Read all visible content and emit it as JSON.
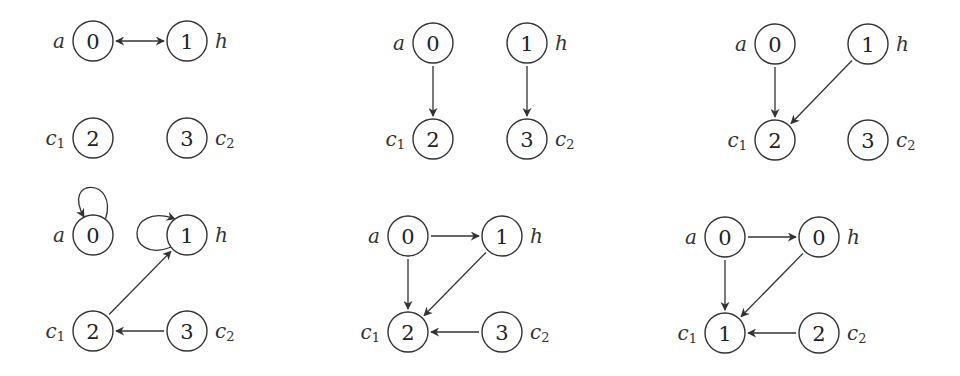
{
  "figure": {
    "width": 960,
    "height": 376,
    "node_radius": 20,
    "colors": {
      "stroke": "#333333",
      "text": "#222222",
      "background": "#ffffff"
    },
    "panels": [
      {
        "id": "p1",
        "nodes": [
          {
            "id": "a",
            "value": "0",
            "label": "a",
            "sub": "",
            "x": 93,
            "y": 41,
            "side": "left"
          },
          {
            "id": "h",
            "value": "1",
            "label": "h",
            "sub": "",
            "x": 187,
            "y": 41,
            "side": "right"
          },
          {
            "id": "c1",
            "value": "2",
            "label": "c",
            "sub": "1",
            "x": 93,
            "y": 138,
            "side": "left"
          },
          {
            "id": "c2",
            "value": "3",
            "label": "c",
            "sub": "2",
            "x": 187,
            "y": 138,
            "side": "right"
          }
        ],
        "edges": [
          {
            "from": "a",
            "to": "h",
            "type": "bidirectional"
          }
        ]
      },
      {
        "id": "p2",
        "nodes": [
          {
            "id": "a",
            "value": "0",
            "label": "a",
            "sub": "",
            "x": 433,
            "y": 43,
            "side": "left"
          },
          {
            "id": "h",
            "value": "1",
            "label": "h",
            "sub": "",
            "x": 527,
            "y": 43,
            "side": "right"
          },
          {
            "id": "c1",
            "value": "2",
            "label": "c",
            "sub": "1",
            "x": 433,
            "y": 139,
            "side": "left"
          },
          {
            "id": "c2",
            "value": "3",
            "label": "c",
            "sub": "2",
            "x": 527,
            "y": 139,
            "side": "right"
          }
        ],
        "edges": [
          {
            "from": "a",
            "to": "c1",
            "type": "directed"
          },
          {
            "from": "h",
            "to": "c2",
            "type": "directed"
          }
        ]
      },
      {
        "id": "p3",
        "nodes": [
          {
            "id": "a",
            "value": "0",
            "label": "a",
            "sub": "",
            "x": 775,
            "y": 44,
            "side": "left"
          },
          {
            "id": "h",
            "value": "1",
            "label": "h",
            "sub": "",
            "x": 868,
            "y": 44,
            "side": "right"
          },
          {
            "id": "c1",
            "value": "2",
            "label": "c",
            "sub": "1",
            "x": 775,
            "y": 140,
            "side": "left"
          },
          {
            "id": "c2",
            "value": "3",
            "label": "c",
            "sub": "2",
            "x": 868,
            "y": 140,
            "side": "right"
          }
        ],
        "edges": [
          {
            "from": "a",
            "to": "c1",
            "type": "directed"
          },
          {
            "from": "h",
            "to": "c1",
            "type": "directed"
          }
        ]
      },
      {
        "id": "p4",
        "nodes": [
          {
            "id": "a",
            "value": "0",
            "label": "a",
            "sub": "",
            "x": 93,
            "y": 235,
            "side": "left"
          },
          {
            "id": "h",
            "value": "1",
            "label": "h",
            "sub": "",
            "x": 187,
            "y": 235,
            "side": "right"
          },
          {
            "id": "c1",
            "value": "2",
            "label": "c",
            "sub": "1",
            "x": 93,
            "y": 331,
            "side": "left"
          },
          {
            "id": "c2",
            "value": "3",
            "label": "c",
            "sub": "2",
            "x": 187,
            "y": 331,
            "side": "right"
          }
        ],
        "edges": [
          {
            "from": "a",
            "to": "a",
            "type": "self-loop",
            "loop_side": "top"
          },
          {
            "from": "h",
            "to": "h",
            "type": "self-loop",
            "loop_side": "left"
          },
          {
            "from": "c1",
            "to": "h",
            "type": "directed"
          },
          {
            "from": "c2",
            "to": "c1",
            "type": "directed"
          }
        ]
      },
      {
        "id": "p5",
        "nodes": [
          {
            "id": "a",
            "value": "0",
            "label": "a",
            "sub": "",
            "x": 408,
            "y": 236,
            "side": "left"
          },
          {
            "id": "h",
            "value": "1",
            "label": "h",
            "sub": "",
            "x": 502,
            "y": 236,
            "side": "right"
          },
          {
            "id": "c1",
            "value": "2",
            "label": "c",
            "sub": "1",
            "x": 408,
            "y": 332,
            "side": "left"
          },
          {
            "id": "c2",
            "value": "3",
            "label": "c",
            "sub": "2",
            "x": 502,
            "y": 332,
            "side": "right"
          }
        ],
        "edges": [
          {
            "from": "a",
            "to": "h",
            "type": "directed"
          },
          {
            "from": "a",
            "to": "c1",
            "type": "directed"
          },
          {
            "from": "h",
            "to": "c1",
            "type": "directed"
          },
          {
            "from": "c2",
            "to": "c1",
            "type": "directed"
          }
        ]
      },
      {
        "id": "p6",
        "nodes": [
          {
            "id": "a",
            "value": "0",
            "label": "a",
            "sub": "",
            "x": 725,
            "y": 237,
            "side": "left"
          },
          {
            "id": "h",
            "value": "0",
            "label": "h",
            "sub": "",
            "x": 819,
            "y": 237,
            "side": "right"
          },
          {
            "id": "c1",
            "value": "1",
            "label": "c",
            "sub": "1",
            "x": 725,
            "y": 333,
            "side": "left"
          },
          {
            "id": "c2",
            "value": "2",
            "label": "c",
            "sub": "2",
            "x": 819,
            "y": 333,
            "side": "right"
          }
        ],
        "edges": [
          {
            "from": "a",
            "to": "h",
            "type": "directed"
          },
          {
            "from": "a",
            "to": "c1",
            "type": "directed"
          },
          {
            "from": "h",
            "to": "c1",
            "type": "directed"
          },
          {
            "from": "c2",
            "to": "c1",
            "type": "directed"
          }
        ]
      }
    ]
  }
}
